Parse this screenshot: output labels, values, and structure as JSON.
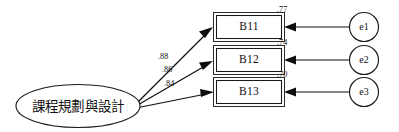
{
  "diagram": {
    "type": "sem-measurement-model",
    "title": "",
    "background_color": "#ffffff",
    "stroke_color": "#111111",
    "latent": {
      "id": "F1",
      "label": "課程規劃與設計",
      "shape": "ellipse"
    },
    "indicators": [
      {
        "id": "B11",
        "label": "B11",
        "loading": ".88",
        "smc": ".77",
        "error": "e1"
      },
      {
        "id": "B12",
        "label": "B12",
        "loading": ".86",
        "smc": ".74",
        "error": "e2"
      },
      {
        "id": "B13",
        "label": "B13",
        "loading": ".84",
        "smc": ".70",
        "error": "e3"
      }
    ],
    "errors": [
      {
        "id": "e1",
        "label": "e1",
        "shape": "circle"
      },
      {
        "id": "e2",
        "label": "e2",
        "shape": "circle"
      },
      {
        "id": "e3",
        "label": "e3",
        "shape": "circle"
      }
    ]
  }
}
